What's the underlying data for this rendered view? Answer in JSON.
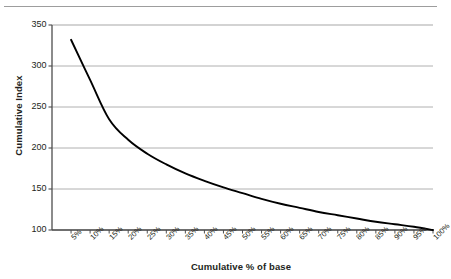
{
  "chart_data": {
    "type": "line",
    "title": "",
    "xlabel": "Cumulative % of base",
    "ylabel": "Cumulative Index",
    "xlim": [
      0,
      100
    ],
    "ylim": [
      100,
      350
    ],
    "grid": true,
    "legend": null,
    "y_ticks": [
      350,
      300,
      250,
      200,
      150,
      100
    ],
    "categories": [
      "5%",
      "10%",
      "15%",
      "20%",
      "25%",
      "30%",
      "35%",
      "40%",
      "45%",
      "50%",
      "55%",
      "60%",
      "65%",
      "70%",
      "75%",
      "80%",
      "85%",
      "90%",
      "95%",
      "100%"
    ],
    "x": [
      5,
      10,
      15,
      20,
      25,
      30,
      35,
      40,
      45,
      50,
      55,
      60,
      65,
      70,
      75,
      80,
      85,
      90,
      95,
      100
    ],
    "values": [
      332,
      283,
      235,
      210,
      193,
      180,
      169,
      160,
      152,
      145,
      138,
      132,
      127,
      122,
      118,
      114,
      110,
      107,
      104,
      100
    ],
    "series": [
      {
        "name": "Cumulative Index",
        "values": [
          332,
          283,
          235,
          210,
          193,
          180,
          169,
          160,
          152,
          145,
          138,
          132,
          127,
          122,
          118,
          114,
          110,
          107,
          104,
          100
        ],
        "color": "#000000"
      }
    ]
  },
  "axes": {
    "y_title": "Cumulative Index",
    "x_title": "Cumulative % of base",
    "y_tick_labels": [
      "350",
      "300",
      "250",
      "200",
      "150",
      "100"
    ],
    "x_tick_labels": [
      "5%",
      "10%",
      "15%",
      "20%",
      "25%",
      "30%",
      "35%",
      "40%",
      "45%",
      "50%",
      "55%",
      "60%",
      "65%",
      "70%",
      "75%",
      "80%",
      "85%",
      "90%",
      "95%",
      "100%"
    ]
  },
  "style": {
    "line_color": "#000000",
    "grid_color": "#a7a7a7",
    "axis_color": "#4d4d4d",
    "rule_color": "#9d9d9d",
    "text_color": "#231f20",
    "background": "#ffffff"
  }
}
